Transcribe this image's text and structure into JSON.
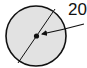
{
  "diagram": {
    "type": "circle-with-center-callout",
    "label": "20",
    "elements": {
      "circle": {
        "fill": "#e2e2e2",
        "stroke": "#111111"
      },
      "diameter_line": true,
      "center_point": true,
      "callout_arrow": {
        "points_to": "center",
        "label": "20"
      }
    }
  }
}
